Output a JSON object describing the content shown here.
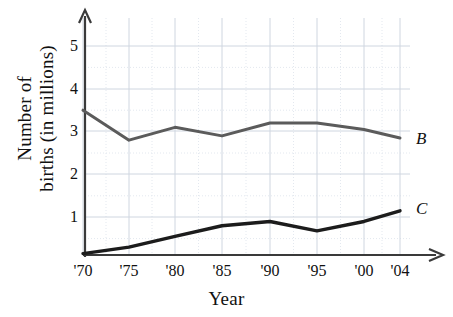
{
  "chart_data": {
    "type": "line",
    "title": "",
    "xlabel": "Year",
    "ylabel": "Number of births (in millions)",
    "ylabel_lines": [
      "Number of",
      "births (in millions)"
    ],
    "x": [
      1970,
      1975,
      1980,
      1985,
      1990,
      1995,
      2000,
      2004
    ],
    "xtick_labels": [
      "'70",
      "'75",
      "'80",
      "'85",
      "'90",
      "'95",
      "'00",
      "'04"
    ],
    "ytick_labels": [
      "1",
      "2",
      "3",
      "4",
      "5"
    ],
    "ytick_values": [
      1,
      2,
      3,
      4,
      5
    ],
    "xlim": [
      1970,
      2004
    ],
    "ylim": [
      0,
      5.6
    ],
    "grid": true,
    "grid_minor": true,
    "legend_position": "right-end-of-line",
    "series": [
      {
        "name": "B",
        "label": "B",
        "color": "#5b5b5b",
        "width": 3.0,
        "values": [
          3.5,
          2.8,
          3.1,
          2.9,
          3.2,
          3.2,
          3.05,
          2.85
        ]
      },
      {
        "name": "C",
        "label": "C",
        "color": "#1c1c1c",
        "width": 3.4,
        "values": [
          0.15,
          0.3,
          0.55,
          0.8,
          0.9,
          0.68,
          0.9,
          1.15
        ]
      }
    ],
    "axes": {
      "axis_color": "#3a3a3a",
      "grid_color": "#cfd6e0",
      "grid_minor_color": "#e3e8ef",
      "arrow_x": true,
      "arrow_y": true
    }
  },
  "geometry": {
    "x_axis_y": 255,
    "y_axis_x": 85,
    "x_positions": [
      83,
      129,
      175,
      222,
      270,
      317,
      364,
      400
    ],
    "y_positions": [
      217,
      174,
      131,
      89,
      46
    ],
    "y_zero": 260,
    "plot_right": 410,
    "plot_top": 18,
    "label_B_x": 416,
    "label_B_y": 139,
    "label_C_x": 416,
    "label_C_y": 209
  }
}
